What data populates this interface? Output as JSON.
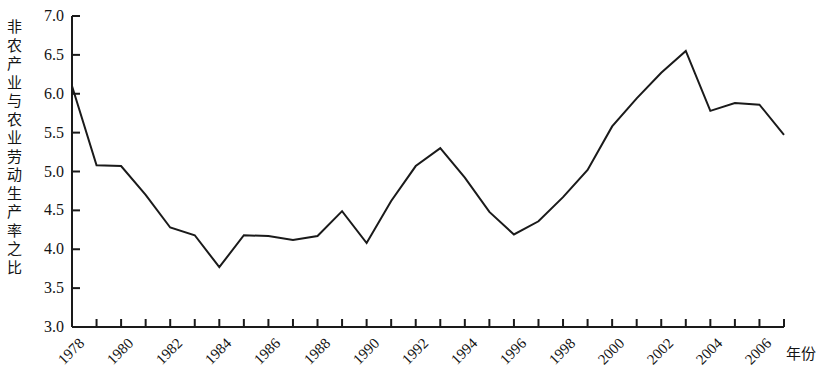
{
  "chart_data": {
    "type": "line",
    "title": "",
    "xlabel": "年份",
    "ylabel": "非农产业与农业劳动生产率之比",
    "xlim": [
      1978,
      2007
    ],
    "ylim": [
      3.0,
      7.0
    ],
    "grid": false,
    "legend": null,
    "y_ticks": [
      "3.0",
      "3.5",
      "4.0",
      "4.5",
      "5.0",
      "5.5",
      "6.0",
      "6.5",
      "7.0"
    ],
    "y_tick_values": [
      3.0,
      3.5,
      4.0,
      4.5,
      5.0,
      5.5,
      6.0,
      6.5,
      7.0
    ],
    "x_ticks": [
      "1978",
      "1980",
      "1982",
      "1984",
      "1986",
      "1988",
      "1990",
      "1992",
      "1994",
      "1996",
      "1998",
      "2000",
      "2002",
      "2004",
      "2006"
    ],
    "x_tick_values": [
      1978,
      1980,
      1982,
      1984,
      1986,
      1988,
      1990,
      1992,
      1994,
      1996,
      1998,
      2000,
      2002,
      2004,
      2006
    ],
    "x_minor_tick_values": [
      1979,
      1981,
      1983,
      1985,
      1987,
      1989,
      1991,
      1993,
      1995,
      1997,
      1999,
      2001,
      2003,
      2005,
      2007
    ],
    "line_color": "#1a1a1a",
    "line_width": 2,
    "series": [
      {
        "name": "非农产业与农业劳动生产率之比",
        "x": [
          1978,
          1979,
          1980,
          1981,
          1982,
          1983,
          1984,
          1985,
          1986,
          1987,
          1988,
          1989,
          1990,
          1991,
          1992,
          1993,
          1994,
          1995,
          1996,
          1997,
          1998,
          1999,
          2000,
          2001,
          2002,
          2003,
          2004,
          2005,
          2006,
          2007
        ],
        "values": [
          6.1,
          5.08,
          5.07,
          4.7,
          4.28,
          4.18,
          3.77,
          4.18,
          4.17,
          4.12,
          4.17,
          4.49,
          4.08,
          4.62,
          5.07,
          5.3,
          4.92,
          4.48,
          4.19,
          4.36,
          4.67,
          5.02,
          5.58,
          5.94,
          6.27,
          6.55,
          5.78,
          5.88,
          5.86,
          5.47
        ]
      }
    ]
  },
  "axes": {
    "y_title": "非农产业与农业劳动生产率之比",
    "x_title": "年份"
  }
}
